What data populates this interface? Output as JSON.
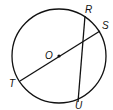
{
  "diagram": {
    "type": "circle-geometry",
    "center_label": "O",
    "points": [
      {
        "label": "R",
        "x": 88,
        "y": 12
      },
      {
        "label": "S",
        "x": 102,
        "y": 28
      },
      {
        "label": "T",
        "x": 10,
        "y": 88
      },
      {
        "label": "U",
        "x": 77,
        "y": 109
      }
    ],
    "segments": [
      {
        "from": "T",
        "to": "S",
        "through": "O",
        "kind": "diameter"
      },
      {
        "from": "R",
        "to": "U",
        "kind": "chord"
      }
    ]
  }
}
